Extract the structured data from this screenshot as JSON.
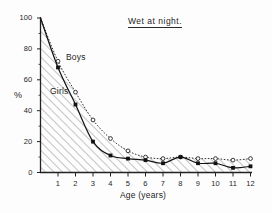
{
  "chart_data": {
    "type": "line",
    "title": "Wet at night.",
    "xlabel": "Age (years)",
    "ylabel": "%",
    "xlim": [
      0,
      12
    ],
    "ylim": [
      0,
      100
    ],
    "grid": false,
    "legend_position": "inline-annotation",
    "x_ticks": [
      "1",
      "2",
      "3",
      "4",
      "5",
      "6",
      "7",
      "8",
      "9",
      "10",
      "11",
      "12"
    ],
    "x_tick_values": [
      1,
      2,
      3,
      4,
      5,
      6,
      7,
      8,
      9,
      10,
      11,
      12
    ],
    "y_ticks": [
      "0",
      "20",
      "40",
      "60",
      "80",
      "100"
    ],
    "y_tick_values": [
      0,
      20,
      40,
      60,
      80,
      100
    ],
    "x": [
      0,
      1,
      2,
      3,
      4,
      5,
      6,
      7,
      8,
      9,
      10,
      11,
      12
    ],
    "series": [
      {
        "name": "Boys",
        "marker": "open-circle",
        "line": "dotted",
        "values": [
          100,
          72,
          52,
          34,
          22,
          14,
          10,
          9,
          10,
          9,
          9,
          8,
          9
        ]
      },
      {
        "name": "Girls",
        "marker": "filled-square",
        "line": "solid",
        "values": [
          100,
          68,
          44,
          20,
          11,
          9,
          8,
          6,
          10,
          6,
          6,
          3,
          4
        ]
      }
    ],
    "annotations": [
      {
        "text": "Boys",
        "x": 1.5,
        "y": 72
      },
      {
        "text": "Girls",
        "x": 0.75,
        "y": 51
      }
    ],
    "shading": "diagonal-hatch-under-girls-curve",
    "colors": {
      "axis": "#222222",
      "boys_line": "#333333",
      "girls_line": "#111111",
      "hatch": "#777777",
      "background": "#fdfdfd"
    }
  }
}
